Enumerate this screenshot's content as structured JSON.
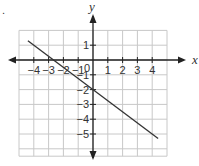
{
  "chart_data": {
    "type": "line",
    "title": "",
    "xlabel": "x",
    "ylabel": "y",
    "xlim": [
      -4.6,
      4.6
    ],
    "ylim": [
      -6.2,
      2.0
    ],
    "grid": true,
    "x_ticks": [
      -4,
      -3,
      -2,
      -1,
      1,
      2,
      3,
      4
    ],
    "y_ticks": [
      1,
      -1,
      -2,
      -3,
      -4,
      -5
    ],
    "x_tick_labels": [
      "−4",
      "−3",
      "−2",
      "−1",
      "1",
      "2",
      "3",
      "4"
    ],
    "y_tick_labels": [
      "1",
      "−1",
      "−2",
      "−3",
      "−4",
      "−5"
    ],
    "origin_label": "0",
    "series": [
      {
        "name": "line",
        "equation": "y = -0.75x - 2",
        "x": [
          -4.4,
          4.4
        ],
        "y": [
          1.3,
          -5.3
        ],
        "color": "#333333"
      }
    ]
  },
  "labels": {
    "x_axis": "x",
    "y_axis": "y",
    "origin": "0",
    "corner_mark": "."
  },
  "colors": {
    "grid": "#c8c8c8",
    "axis": "#222222",
    "line": "#333333"
  }
}
